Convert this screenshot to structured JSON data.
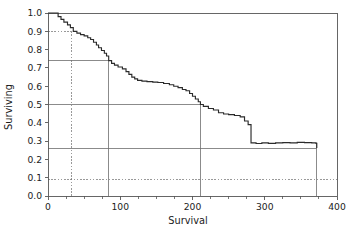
{
  "chart_data": {
    "type": "line",
    "subtype": "kaplan-meier-step",
    "title": "",
    "xlabel": "Survival",
    "ylabel": "Surviving",
    "xlim": [
      0,
      400
    ],
    "ylim": [
      0.0,
      1.0
    ],
    "xticks": [
      0,
      100,
      200,
      300,
      400
    ],
    "xtick_labels": [
      "0",
      "100",
      "200",
      "300",
      "400"
    ],
    "xminor_ticks": [
      25,
      50,
      75,
      125,
      150,
      175,
      225,
      250,
      275,
      325,
      350,
      375
    ],
    "yticks": [
      0.0,
      0.1,
      0.2,
      0.3,
      0.4,
      0.5,
      0.6,
      0.7,
      0.8,
      0.9,
      1.0
    ],
    "ytick_labels": [
      "0.0",
      "0.1",
      "0.2",
      "0.3",
      "0.4",
      "0.5",
      "0.6",
      "0.7",
      "0.8",
      "0.9",
      "1.0"
    ],
    "grid": false,
    "legend": null,
    "curve_color": "#2b2b2b",
    "reference_line_color": "#6e6e6e",
    "frame_color": "#555555",
    "series": [
      {
        "name": "Kaplan-Meier survival estimate",
        "step": "post",
        "x": [
          0,
          9,
          14,
          18,
          22,
          27,
          31,
          35,
          40,
          45,
          50,
          55,
          59,
          63,
          67,
          70,
          74,
          78,
          81,
          84,
          88,
          92,
          97,
          103,
          108,
          112,
          116,
          120,
          124,
          130,
          137,
          145,
          152,
          160,
          168,
          174,
          180,
          186,
          191,
          196,
          200,
          204,
          208,
          211,
          215,
          222,
          229,
          236,
          243,
          250,
          258,
          266,
          272,
          277,
          281,
          288,
          296,
          305,
          315,
          325,
          335,
          345,
          355,
          365,
          371,
          372
        ],
        "y": [
          1.0,
          1.0,
          0.98,
          0.965,
          0.95,
          0.935,
          0.92,
          0.9,
          0.89,
          0.882,
          0.875,
          0.865,
          0.855,
          0.84,
          0.825,
          0.81,
          0.795,
          0.78,
          0.765,
          0.74,
          0.725,
          0.715,
          0.705,
          0.695,
          0.68,
          0.665,
          0.65,
          0.64,
          0.632,
          0.628,
          0.625,
          0.622,
          0.62,
          0.615,
          0.608,
          0.6,
          0.592,
          0.582,
          0.575,
          0.56,
          0.545,
          0.53,
          0.515,
          0.5,
          0.49,
          0.478,
          0.47,
          0.455,
          0.448,
          0.445,
          0.44,
          0.432,
          0.41,
          0.39,
          0.29,
          0.287,
          0.29,
          0.288,
          0.29,
          0.292,
          0.29,
          0.293,
          0.292,
          0.29,
          0.288,
          0.262
        ]
      }
    ],
    "reference_lines": [
      {
        "name": "upper-ci-horizontal",
        "orientation": "horizontal",
        "value": 0.9,
        "style": "dashed",
        "x_from": 0,
        "x_to": 32
      },
      {
        "name": "upper-ci-vertical",
        "orientation": "vertical",
        "value": 32,
        "style": "dashed",
        "y_from": 0.0,
        "y_to": 0.9
      },
      {
        "name": "upper-quartile-horizontal",
        "orientation": "horizontal",
        "value": 0.74,
        "style": "solid",
        "x_from": 0,
        "x_to": 84
      },
      {
        "name": "upper-quartile-vertical",
        "orientation": "vertical",
        "value": 84,
        "style": "solid",
        "y_from": 0.0,
        "y_to": 0.74
      },
      {
        "name": "median-horizontal",
        "orientation": "horizontal",
        "value": 0.5,
        "style": "solid",
        "x_from": 0,
        "x_to": 211
      },
      {
        "name": "median-vertical",
        "orientation": "vertical",
        "value": 211,
        "style": "solid",
        "y_from": 0.0,
        "y_to": 0.5
      },
      {
        "name": "lower-quartile-horizontal",
        "orientation": "horizontal",
        "value": 0.26,
        "style": "solid",
        "x_from": 0,
        "x_to": 372
      },
      {
        "name": "lower-quartile-vertical",
        "orientation": "vertical",
        "value": 372,
        "style": "solid",
        "y_from": 0.0,
        "y_to": 0.29
      },
      {
        "name": "lower-ci-horizontal",
        "orientation": "horizontal",
        "value": 0.09,
        "style": "dashed",
        "x_from": 0,
        "x_to": 400
      }
    ]
  }
}
